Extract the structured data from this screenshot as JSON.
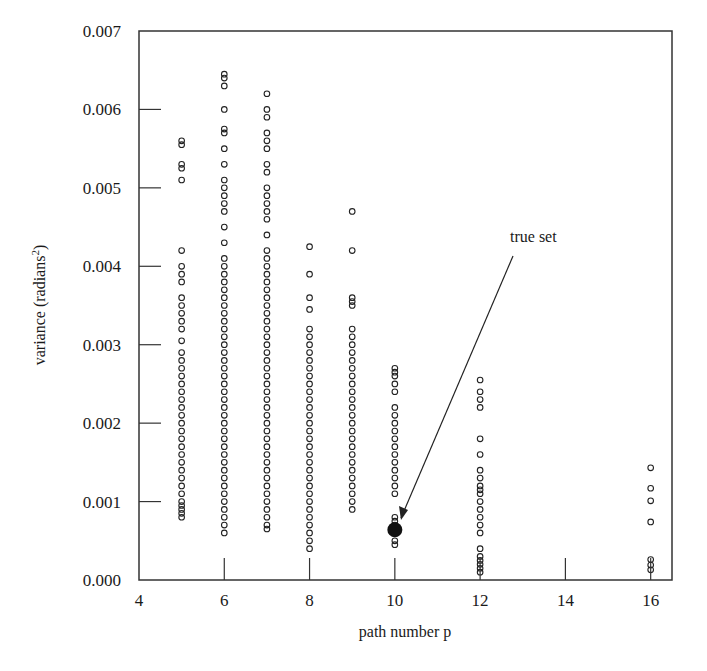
{
  "chart_data": {
    "type": "scatter",
    "title": "",
    "xlabel": "path number p",
    "ylabel": "variance (radians",
    "ylabel_superscript": "2",
    "ylabel_close": ")",
    "xlim": [
      4,
      16.5
    ],
    "ylim": [
      0.0,
      0.007
    ],
    "xticks": [
      4,
      6,
      8,
      10,
      12,
      14,
      16
    ],
    "xtick_labels": [
      "4",
      "6",
      "8",
      "10",
      "12",
      "14",
      "16"
    ],
    "yticks": [
      0.0,
      0.001,
      0.002,
      0.003,
      0.004,
      0.005,
      0.006,
      0.007
    ],
    "ytick_labels": [
      "0.000",
      "0.001",
      "0.002",
      "0.003",
      "0.004",
      "0.005",
      "0.006",
      "0.007"
    ],
    "grid": false,
    "legend": null,
    "marker": "open-circle",
    "series": [
      {
        "name": "p=5",
        "x": 5,
        "y": [
          0.0056,
          0.00555,
          0.0053,
          0.00525,
          0.0051,
          0.0042,
          0.004,
          0.0039,
          0.0038,
          0.0036,
          0.0035,
          0.0034,
          0.0033,
          0.0032,
          0.00305,
          0.0029,
          0.0028,
          0.0027,
          0.0026,
          0.0025,
          0.0024,
          0.0023,
          0.0022,
          0.0021,
          0.002,
          0.0019,
          0.0018,
          0.0017,
          0.0016,
          0.0015,
          0.0014,
          0.0013,
          0.0012,
          0.0011,
          0.001,
          0.00095,
          0.0009,
          0.00085,
          0.0008
        ]
      },
      {
        "name": "p=6",
        "x": 6,
        "y": [
          0.00645,
          0.0064,
          0.0063,
          0.006,
          0.00575,
          0.0057,
          0.0055,
          0.0053,
          0.0051,
          0.005,
          0.0049,
          0.0048,
          0.0047,
          0.0045,
          0.0043,
          0.0041,
          0.004,
          0.0039,
          0.0038,
          0.0037,
          0.0036,
          0.0035,
          0.0034,
          0.0033,
          0.0032,
          0.0031,
          0.003,
          0.0029,
          0.0028,
          0.0027,
          0.0026,
          0.0025,
          0.0024,
          0.0023,
          0.0022,
          0.0021,
          0.002,
          0.0019,
          0.0018,
          0.0017,
          0.0016,
          0.0015,
          0.0014,
          0.0013,
          0.0012,
          0.0011,
          0.001,
          0.0009,
          0.0008,
          0.0007,
          0.0006
        ]
      },
      {
        "name": "p=7",
        "x": 7,
        "y": [
          0.0062,
          0.006,
          0.0059,
          0.0057,
          0.0056,
          0.0055,
          0.0053,
          0.0052,
          0.005,
          0.0049,
          0.0048,
          0.0047,
          0.0046,
          0.0044,
          0.0042,
          0.0041,
          0.004,
          0.0039,
          0.0038,
          0.0037,
          0.0036,
          0.0035,
          0.0034,
          0.0033,
          0.0032,
          0.0031,
          0.003,
          0.0029,
          0.0028,
          0.0027,
          0.0026,
          0.0025,
          0.0024,
          0.0023,
          0.0022,
          0.0021,
          0.002,
          0.0019,
          0.0018,
          0.0017,
          0.0016,
          0.0015,
          0.0014,
          0.0013,
          0.0012,
          0.0011,
          0.001,
          0.0009,
          0.0008,
          0.0007,
          0.00065
        ]
      },
      {
        "name": "p=8",
        "x": 8,
        "y": [
          0.00425,
          0.0039,
          0.0036,
          0.00345,
          0.0032,
          0.0031,
          0.003,
          0.0029,
          0.0028,
          0.0027,
          0.0026,
          0.0025,
          0.0024,
          0.0023,
          0.0022,
          0.0021,
          0.002,
          0.0019,
          0.0018,
          0.0017,
          0.0016,
          0.0015,
          0.0014,
          0.0013,
          0.0012,
          0.0011,
          0.001,
          0.0009,
          0.0008,
          0.0007,
          0.0006,
          0.0005,
          0.0004
        ]
      },
      {
        "name": "p=9",
        "x": 9,
        "y": [
          0.0047,
          0.0042,
          0.0036,
          0.00355,
          0.0035,
          0.0032,
          0.0031,
          0.003,
          0.0029,
          0.0028,
          0.0027,
          0.0026,
          0.0025,
          0.0024,
          0.0023,
          0.0022,
          0.0021,
          0.002,
          0.0019,
          0.0018,
          0.0017,
          0.0016,
          0.0015,
          0.0014,
          0.0013,
          0.0012,
          0.0011,
          0.001,
          0.0009
        ]
      },
      {
        "name": "p=10",
        "x": 10,
        "y": [
          0.0027,
          0.00265,
          0.0026,
          0.0025,
          0.0024,
          0.0022,
          0.0021,
          0.002,
          0.0019,
          0.0018,
          0.0017,
          0.0016,
          0.0015,
          0.0014,
          0.0013,
          0.0012,
          0.0011,
          0.0008,
          0.00075,
          0.0007,
          0.0006,
          0.0005,
          0.00045
        ]
      },
      {
        "name": "p=12",
        "x": 12,
        "y": [
          0.00255,
          0.0024,
          0.0023,
          0.0022,
          0.0018,
          0.0016,
          0.0014,
          0.0013,
          0.0012,
          0.00115,
          0.0011,
          0.001,
          0.0009,
          0.0008,
          0.0007,
          0.0006,
          0.0004,
          0.0003,
          0.00025,
          0.0002,
          0.00015,
          0.0001
        ]
      },
      {
        "name": "p=16",
        "x": 16,
        "y": [
          0.00143,
          0.00117,
          0.00101,
          0.00074,
          0.00026,
          0.00019,
          0.00013
        ]
      }
    ],
    "highlight": {
      "label": "true set",
      "x": 10,
      "y": 0.00064,
      "marker": "filled-circle"
    },
    "annotations": [
      {
        "text": "true set",
        "text_x": 12.9,
        "text_y": 0.0043,
        "arrow_to_x": 10,
        "arrow_to_y": 0.00064
      }
    ]
  }
}
